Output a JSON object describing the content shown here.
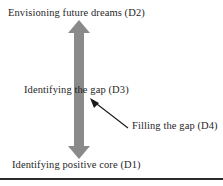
{
  "figure": {
    "background_color": "#ffffff",
    "arrow": {
      "name": "double-headed-vertical-arrow",
      "fill_color": "#8a8a8a",
      "direction": "up-down",
      "shaft_width_px": 12,
      "head_width_px": 22,
      "top_px": 20,
      "bottom_px": 159
    },
    "leader": {
      "name": "pointer-line",
      "stroke_color": "#1a1a1a",
      "from": "Filling the gap (D4)",
      "to": "arrow shaft"
    },
    "rule": {
      "color": "#2b2b2b",
      "thickness_px": 2
    }
  },
  "labels": {
    "top": "Envisioning future dreams (D2)",
    "middle": "Identifying the gap (D3)",
    "callout": "Filling the gap (D4)",
    "bottom": "Identifying positive core (D1)"
  }
}
